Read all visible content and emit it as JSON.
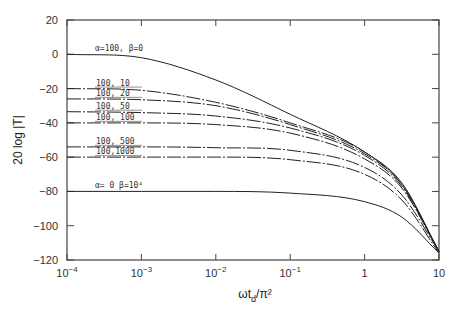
{
  "chart_data": {
    "type": "line",
    "title": "",
    "xlabel": "ωt_d/π²",
    "ylabel": "20 log |T|",
    "xscale": "log",
    "xlim": [
      0.0001,
      10
    ],
    "ylim": [
      -120,
      20
    ],
    "grid": false,
    "x_ticks": [
      {
        "value": 0.0001,
        "base": "10",
        "exp": "-4"
      },
      {
        "value": 0.001,
        "base": "10",
        "exp": "-3"
      },
      {
        "value": 0.01,
        "base": "10",
        "exp": "-2"
      },
      {
        "value": 0.1,
        "base": "10",
        "exp": "-1"
      },
      {
        "value": 1,
        "base": "1",
        "exp": ""
      },
      {
        "value": 10,
        "base": "10",
        "exp": ""
      }
    ],
    "y_ticks": [
      20,
      0,
      -20,
      -40,
      -60,
      -80,
      -100,
      -120
    ],
    "x": [
      0.0001,
      0.001,
      0.01,
      0.1,
      1,
      3.16,
      10
    ],
    "series": [
      {
        "name": "α=100, β=0",
        "label": "α=100, β=0",
        "style": "solid",
        "alpha": 100,
        "beta": 0,
        "values": [
          0,
          -2,
          -15,
          -35,
          -57,
          -75,
          -115
        ]
      },
      {
        "name": "α=100, β=10",
        "label": "100,  10",
        "style": "dashdot",
        "alpha": 100,
        "beta": 10,
        "values": [
          -20,
          -21,
          -28,
          -40,
          -57,
          -76,
          -115
        ]
      },
      {
        "name": "α=100, β=20",
        "label": "100,  20",
        "style": "dashdot",
        "alpha": 100,
        "beta": 20,
        "values": [
          -26,
          -26.5,
          -30,
          -41,
          -58,
          -76,
          -115
        ]
      },
      {
        "name": "α=100, β=50",
        "label": "100,  50",
        "style": "dashdot",
        "alpha": 100,
        "beta": 50,
        "values": [
          -33.5,
          -34,
          -36,
          -43,
          -59,
          -77,
          -115
        ]
      },
      {
        "name": "α=100, β=100",
        "label": "100, 100",
        "style": "dashdot",
        "alpha": 100,
        "beta": 100,
        "values": [
          -40,
          -40,
          -41,
          -46,
          -61,
          -78,
          -115
        ]
      },
      {
        "name": "α=100, β=500",
        "label": "100,  500",
        "style": "dashdot",
        "alpha": 100,
        "beta": 500,
        "values": [
          -54,
          -54,
          -54.5,
          -56,
          -66,
          -82,
          -115
        ]
      },
      {
        "name": "α=100, β=1000",
        "label": "100,1000",
        "style": "dashdot",
        "alpha": 100,
        "beta": 1000,
        "values": [
          -60,
          -60,
          -60,
          -61.5,
          -70,
          -85,
          -116
        ]
      },
      {
        "name": "α=0, β=10^4",
        "label": "α= 0    β=10⁴",
        "style": "solid",
        "alpha": 0,
        "beta": 10000,
        "values": [
          -80,
          -80,
          -80,
          -81,
          -86,
          -95,
          -116
        ]
      }
    ]
  },
  "labels": {
    "ylabel": "20 log |T|",
    "xlabel_main": "ωt",
    "xlabel_sub": "d",
    "xlabel_tail": "/π²"
  }
}
